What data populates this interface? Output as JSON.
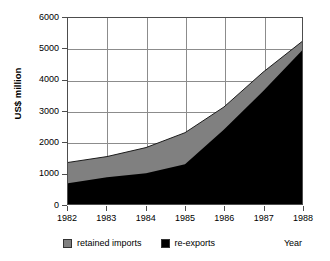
{
  "chart_data": {
    "type": "area",
    "stacked": true,
    "title": "",
    "xlabel": "Year",
    "ylabel": "US$ million",
    "categories": [
      "1982",
      "1983",
      "1984",
      "1985",
      "1986",
      "1987",
      "1988"
    ],
    "x": [
      1982,
      1983,
      1984,
      1985,
      1986,
      1987,
      1988
    ],
    "series": [
      {
        "name": "re-exports",
        "color": "#000000",
        "values": [
          670,
          860,
          990,
          1280,
          2400,
          3640,
          4950
        ]
      },
      {
        "name": "retained imports",
        "color": "#808080",
        "values": [
          670,
          670,
          830,
          1020,
          730,
          610,
          290
        ]
      }
    ],
    "totals": [
      1340,
      1530,
      1820,
      2300,
      3130,
      4250,
      5240
    ],
    "ylim": [
      0,
      6000
    ],
    "yticks": [
      0,
      1000,
      2000,
      3000,
      4000,
      5000,
      6000
    ],
    "ytick_labels": [
      "0",
      "1000",
      "2000",
      "3000",
      "4000",
      "5000",
      "6000"
    ],
    "xlim": [
      1982,
      1988
    ],
    "grid": "both",
    "legend_position": "bottom-left",
    "legend_entries": [
      "retained imports",
      "re-exports"
    ]
  },
  "axes": {
    "y_title": "US$ million",
    "x_title": "Year"
  },
  "legend": {
    "items": [
      {
        "label": "retained imports",
        "color": "#808080"
      },
      {
        "label": "re-exports",
        "color": "#000000"
      }
    ]
  }
}
